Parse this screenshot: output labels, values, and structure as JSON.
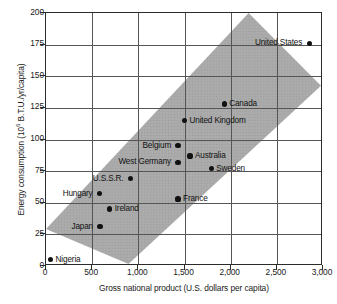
{
  "chart_data": {
    "type": "scatter",
    "title": "",
    "xlabel": "Gross national product (U.S. dollars per capita)",
    "ylabel_prefix": "Energy consumption (10",
    "ylabel_exponent": "6",
    "ylabel_suffix": " B.T.U./yr/capita)",
    "ylabel_full": "Energy consumption (10^6 B.T.U./yr/capita)",
    "xlim": [
      0,
      3000
    ],
    "ylim": [
      0,
      200
    ],
    "xticks": [
      0,
      500,
      1000,
      1500,
      2000,
      2500,
      3000
    ],
    "xtick_labels": [
      "0",
      "500",
      "1,000",
      "1,500",
      "2,000",
      "2,500",
      "3,000"
    ],
    "yticks": [
      0,
      25,
      50,
      75,
      100,
      125,
      150,
      175,
      200
    ],
    "ytick_labels": [
      "0",
      "25",
      "50",
      "75",
      "100",
      "125",
      "150",
      "175",
      "200"
    ],
    "grid": true,
    "legend": "none",
    "band": {
      "name": "correlation-band",
      "color": "#a9a9a9",
      "description": "Diagonal shaded band showing the general trend of energy consumption rising with GNP",
      "lower_right_edge": [
        [
          900,
          0
        ],
        [
          3000,
          142
        ]
      ],
      "upper_left_edge": [
        [
          0,
          28
        ],
        [
          2210,
          200
        ]
      ]
    },
    "point_color": "#111111",
    "points": [
      {
        "name": "Nigeria",
        "x": 50,
        "y": 5,
        "label": "Nigeria",
        "label_side": "right"
      },
      {
        "name": "Japan",
        "x": 585,
        "y": 31,
        "label": "Japan",
        "label_side": "left"
      },
      {
        "name": "Ireland",
        "x": 690,
        "y": 45,
        "label": "Ireland",
        "label_side": "right"
      },
      {
        "name": "Hungary",
        "x": 580,
        "y": 57,
        "label": "Hungary",
        "label_side": "left"
      },
      {
        "name": "France",
        "x": 1430,
        "y": 53,
        "label": "France",
        "label_side": "right"
      },
      {
        "name": "U.S.S.R.",
        "x": 915,
        "y": 69,
        "label": "U.S.S.R.",
        "label_side": "left"
      },
      {
        "name": "Sweden",
        "x": 1790,
        "y": 77,
        "label": "Sweden",
        "label_side": "right"
      },
      {
        "name": "West Germany",
        "x": 1430,
        "y": 82,
        "label": "West Germany",
        "label_side": "left"
      },
      {
        "name": "Australia",
        "x": 1560,
        "y": 87,
        "label": "Australia",
        "label_side": "right"
      },
      {
        "name": "Belgium",
        "x": 1430,
        "y": 95,
        "label": "Belgium",
        "label_side": "left"
      },
      {
        "name": "United Kingdom",
        "x": 1500,
        "y": 115,
        "label": "United Kingdom",
        "label_side": "right"
      },
      {
        "name": "Canada",
        "x": 1930,
        "y": 128,
        "label": "Canada",
        "label_side": "right"
      },
      {
        "name": "United States",
        "x": 2850,
        "y": 176,
        "label": "United States",
        "label_side": "left"
      }
    ]
  }
}
